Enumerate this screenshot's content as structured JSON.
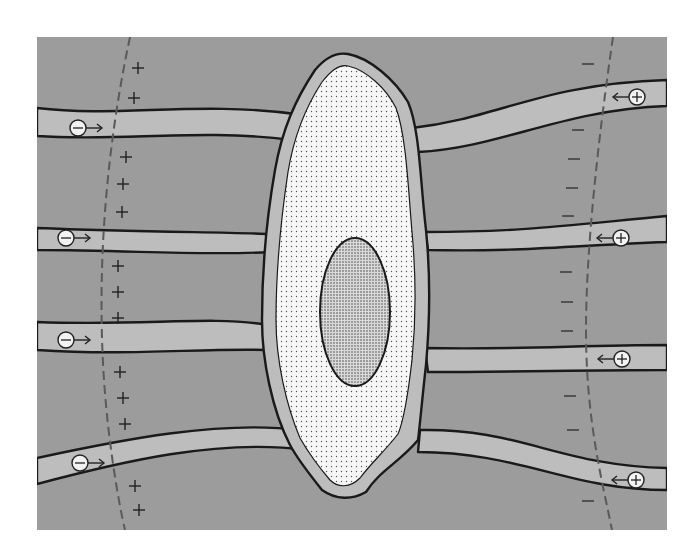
{
  "diagram": {
    "colors": {
      "page_background": "#ffffff",
      "tissue": "#9c9c9c",
      "channel": "#bdbdbd",
      "outline": "#1a1a1a",
      "cytoplasm": "#f7f7f7",
      "nucleus": "#c8c8c8",
      "dashed_line": "#5a5a5a",
      "ion_fill": "#f2f2f2"
    },
    "left_side": {
      "sign": "+",
      "sign_positions": [
        [
          138,
          68
        ],
        [
          134,
          98
        ],
        [
          126,
          157
        ],
        [
          123,
          184
        ],
        [
          122,
          212
        ],
        [
          118,
          266
        ],
        [
          118,
          292
        ],
        [
          118,
          318
        ],
        [
          120,
          372
        ],
        [
          123,
          398
        ],
        [
          125,
          424
        ],
        [
          135,
          486
        ],
        [
          139,
          510
        ]
      ],
      "ions": [
        {
          "label": "−",
          "charge": "negative",
          "direction": "right",
          "x": 78,
          "y": 128
        },
        {
          "label": "−",
          "charge": "negative",
          "direction": "right",
          "x": 66,
          "y": 238
        },
        {
          "label": "−",
          "charge": "negative",
          "direction": "right",
          "x": 66,
          "y": 340
        },
        {
          "label": "−",
          "charge": "negative",
          "direction": "right",
          "x": 80,
          "y": 463
        }
      ]
    },
    "right_side": {
      "sign": "−",
      "sign_positions": [
        [
          588,
          64
        ],
        [
          578,
          130
        ],
        [
          574,
          159
        ],
        [
          572,
          188
        ],
        [
          568,
          216
        ],
        [
          566,
          272
        ],
        [
          567,
          302
        ],
        [
          567,
          331
        ],
        [
          570,
          396
        ],
        [
          573,
          430
        ],
        [
          588,
          501
        ]
      ],
      "ions": [
        {
          "label": "+",
          "charge": "positive",
          "direction": "left",
          "x": 637,
          "y": 97
        },
        {
          "label": "+",
          "charge": "positive",
          "direction": "left",
          "x": 621,
          "y": 238
        },
        {
          "label": "+",
          "charge": "positive",
          "direction": "left",
          "x": 622,
          "y": 359
        },
        {
          "label": "+",
          "charge": "positive",
          "direction": "left",
          "x": 636,
          "y": 480
        }
      ]
    }
  }
}
